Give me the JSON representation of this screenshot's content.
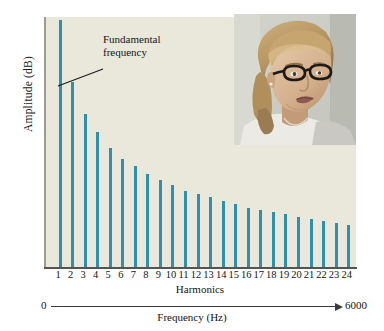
{
  "chart_data": {
    "type": "bar",
    "title": "",
    "xlabel": "Harmonics",
    "ylabel": "Amplitude (dB)",
    "categories": [
      "1",
      "2",
      "3",
      "4",
      "5",
      "6",
      "7",
      "8",
      "9",
      "10",
      "11",
      "12",
      "13",
      "14",
      "15",
      "16",
      "17",
      "18",
      "19",
      "20",
      "21",
      "22",
      "23",
      "24"
    ],
    "values": [
      247,
      185,
      153,
      135,
      120,
      109,
      102,
      94,
      88,
      83,
      77,
      74,
      71,
      67,
      64,
      60,
      58,
      56,
      54,
      51,
      49,
      47,
      45,
      43
    ],
    "ylim": [
      0,
      250
    ],
    "grid": false,
    "legend": null,
    "bar_color": "#2e8fae",
    "plot_background": "#e9e8da",
    "annotations": [
      {
        "text": "Fundamental\nfrequency",
        "points_to_category": "1",
        "leader_from_x": 59,
        "leader_from_y": 52,
        "leader_to_x": 14,
        "leader_to_y": 69
      }
    ],
    "secondary_axis": {
      "label": "Frequency (Hz)",
      "min_label": "0",
      "max_label": "6000",
      "arrow": true
    }
  },
  "figure": {
    "y_axis_label": "Amplitude (dB)",
    "x_axis_label": "Harmonics",
    "annotation_line1": "Fundamental",
    "annotation_line2": "frequency",
    "frequency_axis_label": "Frequency (Hz)",
    "frequency_min": "0",
    "frequency_max": "6000"
  },
  "photo": {
    "alt": "photograph of a woman with eyeglasses speaking, head turned to her left",
    "skin": "#d9bb9a",
    "skin_shadow": "#c09a76",
    "hair": "#c2a173",
    "hair_dark": "#9a7c52",
    "glasses": "#1d1a18",
    "shirt": "#e8e6e2",
    "background": "#cdcfc6"
  }
}
